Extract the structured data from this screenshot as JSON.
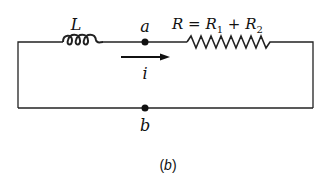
{
  "diagram": {
    "type": "circuit",
    "components": {
      "inductor": {
        "label": "L"
      },
      "resistor": {
        "label_parts": {
          "R": "R",
          "eq": " = ",
          "R1": "R",
          "sub1": "1",
          "plus": " + ",
          "R2": "R",
          "sub2": "2"
        }
      },
      "current": {
        "label": "i",
        "direction": "right"
      }
    },
    "nodes": {
      "a": {
        "label": "a"
      },
      "b": {
        "label": "b"
      }
    },
    "caption": {
      "open": "(",
      "letter": "b",
      "close": ")"
    },
    "colors": {
      "stroke": "#222222",
      "text": "#111111",
      "background": "#ffffff"
    }
  }
}
